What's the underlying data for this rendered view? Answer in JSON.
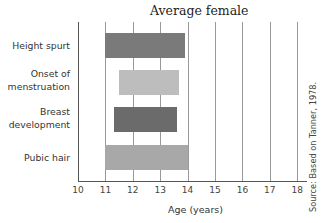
{
  "chart_data": {
    "type": "bar",
    "orientation": "horizontal-range",
    "title": "Average female",
    "xlabel": "Age (years)",
    "ylabel": "",
    "xlim": [
      10,
      18
    ],
    "xticks": [
      "10",
      "11",
      "12",
      "13",
      "14",
      "15",
      "16",
      "17",
      "18"
    ],
    "grid": true,
    "categories": [
      "Height spurt",
      "Onset of menstruation",
      "Breast development",
      "Pubic hair"
    ],
    "series": [
      {
        "name": "Height spurt",
        "start": 11.0,
        "end": 13.9,
        "color": "#7a7a7a"
      },
      {
        "name": "Onset of menstruation",
        "start": 11.5,
        "end": 13.7,
        "color": "#bdbdbd"
      },
      {
        "name": "Breast development",
        "start": 11.3,
        "end": 13.6,
        "color": "#6b6b6b"
      },
      {
        "name": "Pubic hair",
        "start": 11.0,
        "end": 14.0,
        "color": "#a8a8a8"
      }
    ],
    "source": "Source: Based on Tanner, 1978."
  },
  "labels": {
    "title": "Average female",
    "cat0": "Height spurt",
    "cat1a": "Onset of",
    "cat1b": "menstruation",
    "cat2a": "Breast",
    "cat2b": "development",
    "cat3": "Pubic hair",
    "xlabel": "Age (years)",
    "source": "Source: Based on Tanner, 1978."
  }
}
